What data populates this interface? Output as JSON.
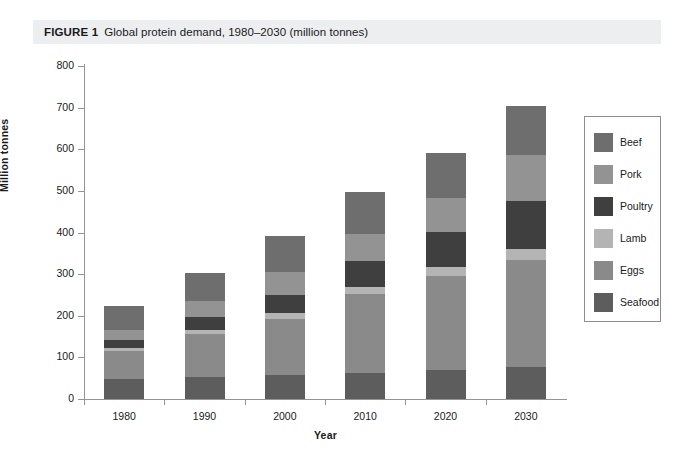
{
  "caption": {
    "label": "FIGURE 1",
    "text": "Global protein demand, 1980–2030 (million tonnes)"
  },
  "chart_data": {
    "type": "bar",
    "stacked": true,
    "title": "Global protein demand, 1980–2030 (million tonnes)",
    "xlabel": "Year",
    "ylabel": "Million tonnes",
    "categories": [
      "1980",
      "1990",
      "2000",
      "2010",
      "2020",
      "2030"
    ],
    "ylim": [
      0,
      800
    ],
    "yticks": [
      0,
      100,
      200,
      300,
      400,
      500,
      600,
      700,
      800
    ],
    "ytick_labels": [
      "0",
      "100",
      "200",
      "300",
      "400",
      "500",
      "600",
      "700",
      "800"
    ],
    "grid": false,
    "legend_position": "right",
    "stack_order_bottom_to_top": [
      "Seafood",
      "Eggs",
      "Lamb",
      "Poultry",
      "Pork",
      "Beef"
    ],
    "series": [
      {
        "name": "Beef",
        "color": "#6e6e6e",
        "values": [
          58,
          68,
          85,
          100,
          108,
          118
        ]
      },
      {
        "name": "Pork",
        "color": "#939393",
        "values": [
          25,
          38,
          55,
          65,
          82,
          110
        ]
      },
      {
        "name": "Poultry",
        "color": "#3f3f3f",
        "values": [
          18,
          30,
          45,
          62,
          85,
          115
        ]
      },
      {
        "name": "Lamb",
        "color": "#b4b4b4",
        "values": [
          8,
          10,
          14,
          18,
          22,
          28
        ]
      },
      {
        "name": "Eggs",
        "color": "#8a8a8a",
        "values": [
          68,
          105,
          135,
          190,
          225,
          255
        ]
      },
      {
        "name": "Seafood",
        "color": "#5d5d5d",
        "values": [
          47,
          52,
          57,
          62,
          70,
          78
        ]
      }
    ],
    "totals": [
      224,
      303,
      391,
      497,
      592,
      704
    ],
    "annotations": []
  },
  "legend": {
    "items": [
      {
        "label": "Beef",
        "color": "#6e6e6e"
      },
      {
        "label": "Pork",
        "color": "#939393"
      },
      {
        "label": "Poultry",
        "color": "#3f3f3f"
      },
      {
        "label": "Lamb",
        "color": "#b4b4b4"
      },
      {
        "label": "Eggs",
        "color": "#8a8a8a"
      },
      {
        "label": "Seafood",
        "color": "#5d5d5d"
      }
    ]
  },
  "colors": {
    "caption_background": "#eceef0",
    "axis": "#949494",
    "text": "#1a1a1a",
    "page_background": "#ffffff"
  }
}
